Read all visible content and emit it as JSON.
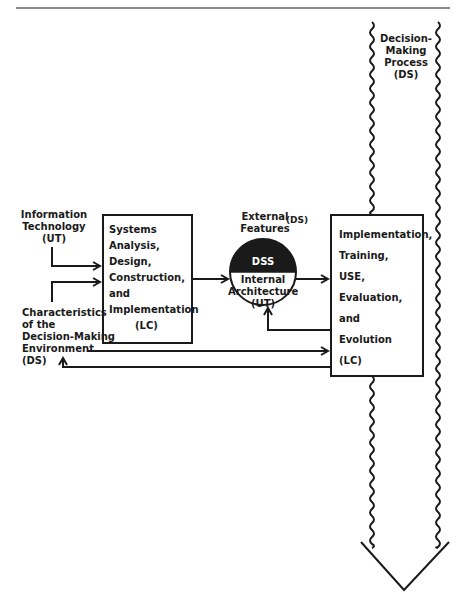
{
  "diagram": {
    "type": "flow",
    "colors": {
      "ink": "#1a1a1a",
      "rule": "#8a8a8a",
      "background": "#ffffff"
    },
    "decision_process": {
      "lines": [
        "Decision-",
        "Making",
        "Process",
        "(DS)"
      ]
    },
    "inputs": {
      "information_technology": {
        "lines": [
          "Information",
          "Technology",
          "(UT)"
        ]
      },
      "characteristics": {
        "lines": [
          "Characteristics",
          "of the",
          "Decision-Making",
          "Environment",
          "(DS)"
        ]
      }
    },
    "box_systems": {
      "lines": [
        "Systems",
        "Analysis,",
        "Design,",
        "Construction,",
        "and",
        "Implementation",
        "(LC)"
      ]
    },
    "dss_circle": {
      "external_label": "External",
      "external_label2": "Features",
      "external_tag": "(DS)",
      "top_label": "DSS",
      "bottom_lines": [
        "Internal",
        "Architecture",
        "(UT)"
      ]
    },
    "box_implementation": {
      "lines": [
        "Implementation,",
        "Training,",
        "USE,",
        "Evaluation,",
        "and",
        "Evolution",
        "(LC)"
      ]
    },
    "edges": [
      {
        "from": "Information Technology",
        "to": "Systems Analysis box"
      },
      {
        "from": "Characteristics of the Decision-Making Environment",
        "to": "Systems Analysis box"
      },
      {
        "from": "Systems Analysis box",
        "to": "DSS"
      },
      {
        "from": "DSS",
        "to": "Implementation box"
      },
      {
        "from": "Implementation box",
        "to": "DSS",
        "kind": "feedback"
      },
      {
        "from": "Characteristics of the Decision-Making Environment",
        "to": "Implementation box"
      },
      {
        "from": "Implementation box",
        "to": "Characteristics of the Decision-Making Environment",
        "kind": "feedback"
      }
    ]
  }
}
